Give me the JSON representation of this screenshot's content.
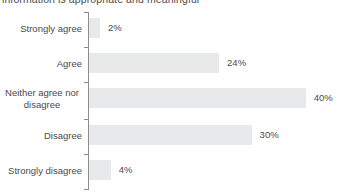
{
  "chart_data": {
    "type": "bar",
    "orientation": "horizontal",
    "title": "information is appropriate and meaningful",
    "xlabel": "",
    "ylabel": "",
    "categories": [
      "Strongly agree",
      "Agree",
      "Neither agree nor disagree",
      "Disagree",
      "Strongly disagree"
    ],
    "values": [
      2,
      24,
      40,
      30,
      4
    ],
    "value_labels": [
      "2%",
      "24%",
      "40%",
      "30%",
      "4%"
    ],
    "xlim": [
      0,
      40
    ],
    "grid": false,
    "legend": null,
    "bar_color": "#e7e9eb",
    "axis_color": "#8c8c8c",
    "text_color": "#4a4a4a"
  },
  "rows": [
    {
      "label": "Strongly agree",
      "label_line1": "Strongly agree",
      "label_line2": "",
      "value": 2,
      "value_label": "2%"
    },
    {
      "label": "Agree",
      "label_line1": "Agree",
      "label_line2": "",
      "value": 24,
      "value_label": "24%"
    },
    {
      "label": "Neither agree nor disagree",
      "label_line1": "Neither agree nor",
      "label_line2": "disagree",
      "value": 40,
      "value_label": "40%"
    },
    {
      "label": "Disagree",
      "label_line1": "Disagree",
      "label_line2": "",
      "value": 30,
      "value_label": "30%"
    },
    {
      "label": "Strongly disagree",
      "label_line1": "Strongly disagree",
      "label_line2": "",
      "value": 4,
      "value_label": "4%"
    }
  ]
}
